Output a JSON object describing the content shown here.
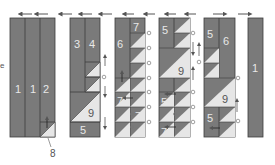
{
  "colors": {
    "dark_fabric": "#7a7a7a",
    "light_fabric": "#e6e6e6",
    "seam": "#3c3c3c",
    "arrow": "#555555",
    "circle_marker": "#777777"
  },
  "top_arrows": [
    {
      "x": 28,
      "dir": "left"
    },
    {
      "x": 45,
      "dir": "left"
    },
    {
      "x": 66,
      "dir": "left"
    },
    {
      "x": 86,
      "dir": "left"
    },
    {
      "x": 108,
      "dir": "left"
    },
    {
      "x": 131,
      "dir": "left"
    },
    {
      "x": 152,
      "dir": "left"
    },
    {
      "x": 172,
      "dir": "left"
    },
    {
      "x": 192,
      "dir": "left"
    },
    {
      "x": 218,
      "dir": "right"
    },
    {
      "x": 244,
      "dir": "right"
    }
  ],
  "left_margin_glyph": "e",
  "strips": {
    "group1": {
      "labels": [
        "1",
        "1",
        "2"
      ],
      "callout": "8"
    },
    "group2": {
      "labels": [
        "3",
        "4",
        "9",
        "5"
      ]
    },
    "group3": {
      "labels": [
        "6",
        "7",
        "7",
        "7"
      ]
    },
    "group4": {
      "labels": [
        "5",
        "9",
        "5",
        "7"
      ]
    },
    "group5": {
      "labels": [
        "5",
        "6",
        "9",
        "5"
      ]
    },
    "group6": {
      "labels": [
        "1"
      ]
    }
  }
}
